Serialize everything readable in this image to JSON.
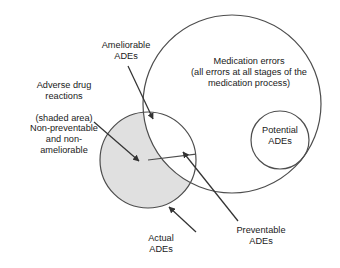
{
  "figure": {
    "type": "venn-diagram",
    "background": "#ffffff",
    "stroke_color": "#4d4d4d",
    "shade_color": "#e0e0e0"
  },
  "labels": {
    "ameliorable": "Ameliorable\nADEs",
    "adverse_drug_reactions": "Adverse drug\nreactions\n\n(shaded area)\nNon-preventable\nand non-\nameliorable",
    "medication_errors": "Medication errors\n(all errors at all stages of the\nmedication process)",
    "potential": "Potential\nADEs",
    "preventable": "Preventable\nADEs",
    "actual": "Actual\nADEs"
  },
  "shapes": {
    "actual_ades_circle": {
      "cx": 148,
      "cy": 160,
      "r": 48,
      "fill": "#e0e0e0"
    },
    "medication_errors_circle": {
      "cx": 232,
      "cy": 104,
      "r": 89,
      "fill": "none"
    },
    "potential_ades_circle": {
      "cx": 280,
      "cy": 140,
      "r": 29,
      "fill": "none"
    }
  },
  "arrows": [
    {
      "name": "ameliorable",
      "x1": 128,
      "y1": 66,
      "x2": 153,
      "y2": 119
    },
    {
      "name": "adverse-drug-reactions",
      "x1": 94,
      "y1": 122,
      "x2": 139,
      "y2": 161
    },
    {
      "name": "preventable",
      "x1": 238,
      "y1": 221,
      "x2": 183,
      "y2": 152
    },
    {
      "name": "actual",
      "x1": 196,
      "y1": 232,
      "x2": 169,
      "y2": 207
    }
  ]
}
